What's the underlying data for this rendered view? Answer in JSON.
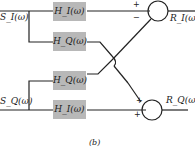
{
  "inputs": {
    "top": "S_I(ω)",
    "bottom": "S_Q(ω)"
  },
  "outputs": {
    "top": "R_I(ω)",
    "bottom": "R_Q(ω)"
  },
  "blocks": [
    {
      "label": "H_I(ω)"
    },
    {
      "label": "H_Q(ω)"
    },
    {
      "label": "H_Q(ω)"
    },
    {
      "label": "H_I(ω)"
    }
  ],
  "summers": {
    "top": {
      "plus": "+",
      "minus": "−"
    },
    "bottom": {
      "plus1": "+",
      "plus2": "+"
    }
  },
  "caption": "(b)"
}
